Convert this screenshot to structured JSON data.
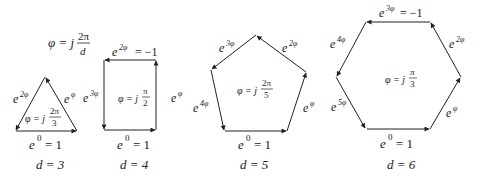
{
  "header": {
    "formula_lhs": "φ = j",
    "formula_num": "2π",
    "formula_den": "d"
  },
  "diagrams": [
    {
      "d_label": "d = 3",
      "bottom": "= 1",
      "bottom_base": "e",
      "bottom_exp": "0",
      "phi_lhs": "φ = j",
      "phi_num": "2π",
      "phi_den": "3",
      "edges": [
        {
          "base": "e",
          "exp": "φ"
        },
        {
          "base": "e",
          "exp": "2φ"
        }
      ]
    },
    {
      "d_label": "d = 4",
      "bottom_base": "e",
      "bottom_exp": "0",
      "bottom": "= 1",
      "phi_lhs": "φ = j",
      "phi_num": "π",
      "phi_den": "2",
      "edges": [
        {
          "base": "e",
          "exp": "φ"
        },
        {
          "base": "e",
          "exp": "2φ",
          "suffix": "= −1"
        },
        {
          "base": "e",
          "exp": "3φ"
        }
      ]
    },
    {
      "d_label": "d = 5",
      "bottom_base": "e",
      "bottom_exp": "0",
      "bottom": "= 1",
      "phi_lhs": "φ = j",
      "phi_num": "2π",
      "phi_den": "5",
      "edges": [
        {
          "base": "e",
          "exp": "φ"
        },
        {
          "base": "e",
          "exp": "2φ"
        },
        {
          "base": "e",
          "exp": "3φ"
        },
        {
          "base": "e",
          "exp": "4φ"
        }
      ]
    },
    {
      "d_label": "d = 6",
      "bottom_base": "e",
      "bottom_exp": "0",
      "bottom": "= 1",
      "phi_lhs": "φ = j",
      "phi_num": "π",
      "phi_den": "3",
      "edges": [
        {
          "base": "e",
          "exp": "φ"
        },
        {
          "base": "e",
          "exp": "2φ"
        },
        {
          "base": "e",
          "exp": "3φ",
          "suffix": "= −1"
        },
        {
          "base": "e",
          "exp": "4φ"
        },
        {
          "base": "e",
          "exp": "5φ"
        }
      ]
    }
  ]
}
